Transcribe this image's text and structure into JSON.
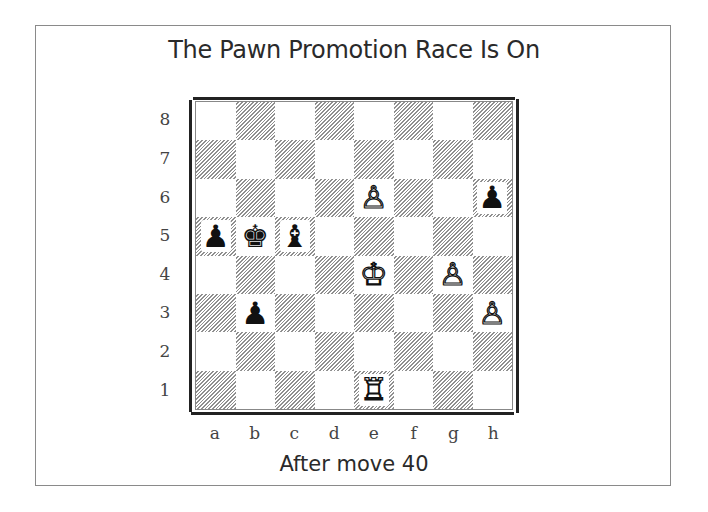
{
  "title": "The Pawn Promotion Race Is On",
  "caption": "After move 40",
  "board": {
    "files": [
      "a",
      "b",
      "c",
      "d",
      "e",
      "f",
      "g",
      "h"
    ],
    "ranks": [
      "8",
      "7",
      "6",
      "5",
      "4",
      "3",
      "2",
      "1"
    ],
    "light_square_color": "#ffffff",
    "dark_square_style": "diagonal-hatch",
    "hatch_color": "#8f8f8f",
    "pieces": [
      {
        "square": "e6",
        "color": "white",
        "type": "pawn",
        "glyph": "♙",
        "name": "white-pawn-e6"
      },
      {
        "square": "h6",
        "color": "black",
        "type": "pawn",
        "glyph": "♟",
        "name": "black-pawn-h6"
      },
      {
        "square": "a5",
        "color": "black",
        "type": "pawn",
        "glyph": "♟",
        "name": "black-pawn-a5"
      },
      {
        "square": "b5",
        "color": "black",
        "type": "king",
        "glyph": "♚",
        "name": "black-king-b5"
      },
      {
        "square": "c5",
        "color": "black",
        "type": "bishop",
        "glyph": "♝",
        "name": "black-bishop-c5"
      },
      {
        "square": "e4",
        "color": "white",
        "type": "king",
        "glyph": "♔",
        "name": "white-king-e4"
      },
      {
        "square": "g4",
        "color": "white",
        "type": "pawn",
        "glyph": "♙",
        "name": "white-pawn-g4"
      },
      {
        "square": "b3",
        "color": "black",
        "type": "pawn",
        "glyph": "♟",
        "name": "black-pawn-b3"
      },
      {
        "square": "h3",
        "color": "white",
        "type": "pawn",
        "glyph": "♙",
        "name": "white-pawn-h3"
      },
      {
        "square": "e1",
        "color": "white",
        "type": "rook",
        "glyph": "♖",
        "name": "white-rook-e1"
      }
    ]
  }
}
